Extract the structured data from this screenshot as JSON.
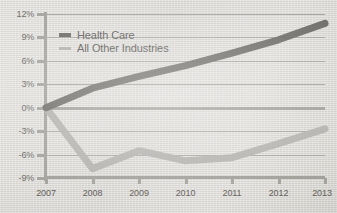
{
  "chart_data": {
    "type": "line",
    "title": "",
    "subtitle": "",
    "xlabel": "",
    "ylabel": "",
    "x": [
      2007,
      2008,
      2009,
      2010,
      2011,
      2012,
      2013
    ],
    "categories": [
      "2007",
      "2008",
      "2009",
      "2010",
      "2011",
      "2012",
      "2013"
    ],
    "xlim": [
      2007,
      2013
    ],
    "ylim": [
      -9,
      12
    ],
    "ytick_labels": [
      "12%",
      "9%",
      "6%",
      "3%",
      "0%",
      "-3%",
      "-6%",
      "-9%"
    ],
    "ytick_values": [
      12,
      9,
      6,
      3,
      0,
      -3,
      -6,
      -9
    ],
    "xtick_labels": [
      "2007",
      "2008",
      "2009",
      "2010",
      "2011",
      "2012",
      "2013"
    ],
    "grid": true,
    "zero_line_emphasized": true,
    "legend_position": "upper-left-inside",
    "series": [
      {
        "name": "Health Care",
        "color": "#6e6c68",
        "values": [
          0.0,
          2.5,
          4.0,
          5.4,
          7.0,
          8.7,
          10.8
        ]
      },
      {
        "name": "All Other Industries",
        "color": "#b4b2ae",
        "values": [
          0.0,
          -7.8,
          -5.5,
          -6.8,
          -6.4,
          -4.6,
          -2.7
        ]
      }
    ]
  },
  "legend": {
    "items": [
      {
        "label": "Health Care",
        "swatch": "dash-dark"
      },
      {
        "label": "All Other Industries",
        "swatch": "dash-light"
      }
    ]
  },
  "axes": {
    "y_labels": [
      "12%",
      "9%",
      "6%",
      "3%",
      "0%",
      "-3%",
      "-6%",
      "-9%"
    ],
    "x_labels": [
      "2007",
      "2008",
      "2009",
      "2010",
      "2011",
      "2012",
      "2013"
    ]
  },
  "colors": {
    "health_care": "#6e6c68",
    "all_other": "#b4b2ae",
    "gridline": "#a9a7a3",
    "axis": "#a5a39e",
    "background": "#dddbd7",
    "label_text": "#5f5d59"
  }
}
